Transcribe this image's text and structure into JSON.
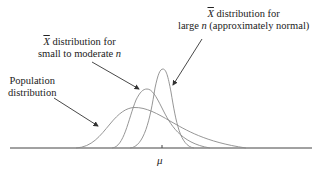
{
  "diagram": {
    "title": "",
    "labels": {
      "population": {
        "line1": "Population",
        "line2": "distribution"
      },
      "small": {
        "symbol": "X",
        "line1_rest": " distribution for",
        "line2_pre": "small to moderate ",
        "line2_var": "n"
      },
      "large": {
        "symbol": "X",
        "line1_rest": " distribution for",
        "line2_pre": "large ",
        "line2_var": "n",
        "line2_post": " (approximately normal)"
      },
      "axis_tick": "μ"
    },
    "colors": {
      "curve": "#8a8a8a",
      "axis": "#444444",
      "arrow": "#333333",
      "text": "#222222"
    },
    "curves": [
      {
        "name": "population-distribution",
        "description": "wide, right-skewed"
      },
      {
        "name": "xbar-small-moderate-n",
        "description": "narrower, slightly skewed"
      },
      {
        "name": "xbar-large-n",
        "description": "narrowest, approximately normal, centered at μ"
      }
    ]
  }
}
